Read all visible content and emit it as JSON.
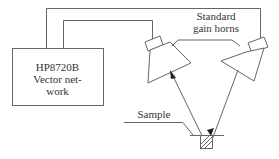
{
  "diagram": {
    "instrument": {
      "line1": "HP8720B",
      "line2": "Vector net-",
      "line3": "work"
    },
    "horns_label": {
      "line1": "Standard",
      "line2": "gain horns"
    },
    "sample_label": "Sample",
    "colors": {
      "line": "#555555",
      "text": "#333333"
    }
  }
}
